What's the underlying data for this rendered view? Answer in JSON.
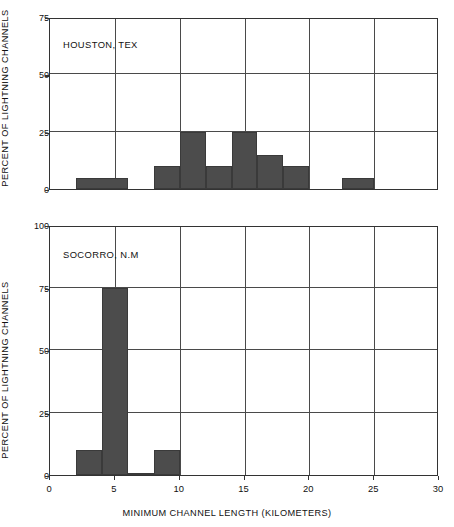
{
  "figure": {
    "xlabel": "MINIMUM CHANNEL LENGTH (KILOMETERS)",
    "ylabel": "PERCENT OF LIGHTNING CHANNELS",
    "bar_color": "#4c4c4c",
    "axis_color": "#333333",
    "grid_color": "#4a4a4a"
  },
  "panels": [
    {
      "id": "houston",
      "annotation": "HOUSTON, TEX",
      "yticks": [
        "0",
        "25",
        "50",
        "75"
      ],
      "xticks": [
        "0",
        "5",
        "10",
        "15",
        "20",
        "25",
        "30"
      ]
    },
    {
      "id": "socorro",
      "annotation": "SOCORRO, N.M",
      "yticks": [
        "0",
        "25",
        "50",
        "75",
        "100"
      ],
      "xticks": [
        "0",
        "5",
        "10",
        "15",
        "20",
        "25",
        "30"
      ]
    }
  ],
  "chart_data": [
    {
      "type": "bar",
      "title": "HOUSTON, TEX",
      "xlabel": "MINIMUM CHANNEL LENGTH (KILOMETERS)",
      "ylabel": "PERCENT OF LIGHTNING CHANNELS",
      "xlim": [
        0,
        30
      ],
      "ylim": [
        0,
        75
      ],
      "xticks": [
        0,
        5,
        10,
        15,
        20,
        25,
        30
      ],
      "yticks": [
        0,
        25,
        50,
        75
      ],
      "grid": true,
      "legend": "none",
      "bins": [
        {
          "x0": 2,
          "x1": 6,
          "value": 5
        },
        {
          "x0": 8,
          "x1": 10,
          "value": 10
        },
        {
          "x0": 10,
          "x1": 12,
          "value": 25
        },
        {
          "x0": 12,
          "x1": 14,
          "value": 10
        },
        {
          "x0": 14,
          "x1": 16,
          "value": 25
        },
        {
          "x0": 16,
          "x1": 18,
          "value": 15
        },
        {
          "x0": 18,
          "x1": 20,
          "value": 10
        },
        {
          "x0": 22.5,
          "x1": 25,
          "value": 5
        }
      ]
    },
    {
      "type": "bar",
      "title": "SOCORRO, N.M",
      "xlabel": "MINIMUM CHANNEL LENGTH (KILOMETERS)",
      "ylabel": "PERCENT OF LIGHTNING CHANNELS",
      "xlim": [
        0,
        30
      ],
      "ylim": [
        0,
        100
      ],
      "xticks": [
        0,
        5,
        10,
        15,
        20,
        25,
        30
      ],
      "yticks": [
        0,
        25,
        50,
        75,
        100
      ],
      "grid": true,
      "legend": "none",
      "bins": [
        {
          "x0": 2,
          "x1": 4,
          "value": 10
        },
        {
          "x0": 4,
          "x1": 6,
          "value": 75
        },
        {
          "x0": 6,
          "x1": 8,
          "value": 1
        },
        {
          "x0": 8,
          "x1": 10,
          "value": 10
        }
      ]
    }
  ]
}
